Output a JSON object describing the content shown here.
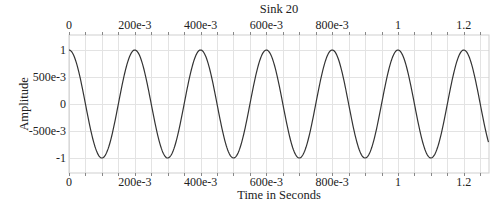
{
  "chart_data": {
    "type": "line",
    "title": "Sink 20",
    "xlabel": "Time in Seconds",
    "ylabel": "Amplitude",
    "xlim": [
      0,
      1.275
    ],
    "ylim": [
      -1.2,
      1.2
    ],
    "grid": true,
    "legend": null,
    "x_ticks": [
      0,
      0.2,
      0.4,
      0.6,
      0.8,
      1.0,
      1.2
    ],
    "x_tick_labels": [
      "0",
      "200e-3",
      "400e-3",
      "600e-3",
      "800e-3",
      "1",
      "1.2"
    ],
    "x_minor_step": 0.05,
    "y_ticks": [
      1,
      0.5,
      0,
      -0.5,
      -1
    ],
    "y_tick_labels": [
      "1",
      "500e-3",
      "0",
      "-500e-3",
      "-1"
    ],
    "series": [
      {
        "name": "Sink 20",
        "function": "cos(2*pi*f*t)",
        "frequency_hz": 5,
        "amplitude": 1,
        "t_start": 0,
        "t_end": 1.275,
        "color": "#333333"
      }
    ]
  },
  "colors": {
    "background": "#ffffff",
    "grid": "#e3e3e3",
    "frame": "#cfcfcf",
    "trace": "#333333",
    "text": "#222222"
  }
}
